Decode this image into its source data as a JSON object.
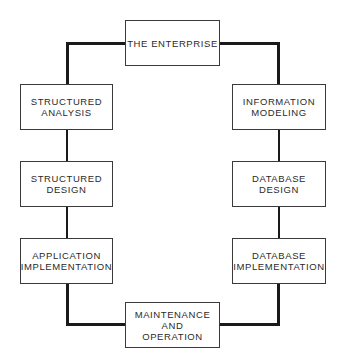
{
  "diagram": {
    "nodes": {
      "enterprise": "THE ENTERPRISE",
      "structured_analysis": "STRUCTURED\nANALYSIS",
      "information_modeling": "INFORMATION\nMODELING",
      "structured_design": "STRUCTURED\nDESIGN",
      "database_design": "DATABASE\nDESIGN",
      "application_implementation": "APPLICATION\nIMPLEMENTATION",
      "database_implementation": "DATABASE\nIMPLEMENTATION",
      "maintenance_operation": "MAINTENANCE\nAND\nOPERATION"
    },
    "colors": {
      "line": "#1a1a1a",
      "border": "#3a3a3a",
      "text": "#2a2a2a",
      "background": "#ffffff"
    }
  }
}
